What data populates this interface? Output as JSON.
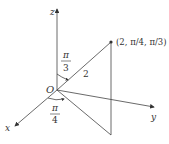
{
  "diagram": {
    "axes": {
      "x": "x",
      "y": "y",
      "z": "z"
    },
    "origin_label": "O",
    "point_label": "(2, π/4, π/3)",
    "radius_label": "2",
    "phi_angle": {
      "num": "π",
      "den": "3"
    },
    "theta_angle": {
      "num": "π",
      "den": "4"
    }
  }
}
